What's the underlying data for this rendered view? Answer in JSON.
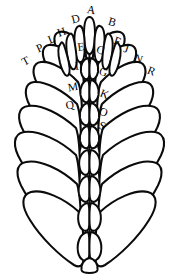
{
  "figure": {
    "background_color": "#ffffff",
    "ink_color": "#0b0b0b",
    "label_color": "#000000",
    "labels": [
      {
        "id": "label-A",
        "text": "A",
        "x": 91,
        "y": 11,
        "rotate": 8
      },
      {
        "id": "label-B",
        "text": "B",
        "x": 112,
        "y": 23,
        "rotate": 16
      },
      {
        "id": "label-C",
        "text": "C",
        "x": 100,
        "y": 51,
        "rotate": 22
      },
      {
        "id": "label-D",
        "text": "D",
        "x": 76,
        "y": 20,
        "rotate": -14
      },
      {
        "id": "label-E",
        "text": "E",
        "x": 81,
        "y": 48,
        "rotate": -8
      },
      {
        "id": "label-F",
        "text": "F",
        "x": 117,
        "y": 42,
        "rotate": 20
      },
      {
        "id": "label-G",
        "text": "G",
        "x": 103,
        "y": 73,
        "rotate": 20
      },
      {
        "id": "label-H",
        "text": "H",
        "x": 62,
        "y": 33,
        "rotate": -20
      },
      {
        "id": "label-I",
        "text": "I",
        "x": 77,
        "y": 67,
        "rotate": -6
      },
      {
        "id": "label-J",
        "text": "J",
        "x": 126,
        "y": 50,
        "rotate": 18
      },
      {
        "id": "label-K",
        "text": "K",
        "x": 104,
        "y": 95,
        "rotate": 22
      },
      {
        "id": "label-L",
        "text": "L",
        "x": 52,
        "y": 40,
        "rotate": -22
      },
      {
        "id": "label-M",
        "text": "M",
        "x": 73,
        "y": 88,
        "rotate": -10
      },
      {
        "id": "label-N",
        "text": "N",
        "x": 138,
        "y": 60,
        "rotate": 20
      },
      {
        "id": "label-O",
        "text": "O",
        "x": 103,
        "y": 113,
        "rotate": 22
      },
      {
        "id": "label-P",
        "text": "P",
        "x": 40,
        "y": 49,
        "rotate": -24
      },
      {
        "id": "label-Q",
        "text": "Q",
        "x": 70,
        "y": 106,
        "rotate": -12
      },
      {
        "id": "label-R",
        "text": "R",
        "x": 151,
        "y": 72,
        "rotate": 22
      },
      {
        "id": "label-S",
        "text": "S",
        "x": 102,
        "y": 127,
        "rotate": 18
      },
      {
        "id": "label-T",
        "text": "T",
        "x": 26,
        "y": 62,
        "rotate": -28
      }
    ],
    "label_sequence": "A B C D E F G H I J K L M N O P Q R S T",
    "label_count": 20
  }
}
